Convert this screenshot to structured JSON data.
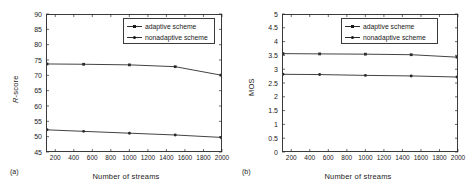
{
  "figure": {
    "panels": [
      {
        "tag": "(a)",
        "xlabel": "Number of streams",
        "ylabel_prefix": "R",
        "ylabel_suffix": "-score"
      },
      {
        "tag": "(b)",
        "xlabel": "Number of streams",
        "ylabel": "MOS"
      }
    ],
    "legend": {
      "adaptive": "adaptive scheme",
      "nonadaptive": "nonadaptive scheme"
    },
    "colors": {
      "line": "#2b2b2b",
      "frame": "#3a3a3a",
      "text": "#1a1a1a",
      "background": "#ffffff"
    }
  },
  "chart_data": [
    {
      "type": "line",
      "title": "",
      "panel": "(a)",
      "xlabel": "Number of streams",
      "ylabel": "R-score",
      "xlim": [
        100,
        2000
      ],
      "ylim": [
        45,
        90
      ],
      "yticks": [
        45,
        50,
        55,
        60,
        65,
        70,
        75,
        80,
        85,
        90
      ],
      "xticks": [
        200,
        400,
        600,
        800,
        1000,
        1200,
        1400,
        1600,
        1800,
        2000
      ],
      "grid": false,
      "legend_position": "top-right",
      "x": [
        100,
        500,
        1000,
        1500,
        2000
      ],
      "series": [
        {
          "name": "adaptive scheme",
          "values": [
            73.8,
            73.7,
            73.5,
            72.9,
            70.1
          ]
        },
        {
          "name": "nonadaptive scheme",
          "values": [
            52.0,
            51.5,
            50.9,
            50.3,
            49.5
          ]
        }
      ]
    },
    {
      "type": "line",
      "title": "",
      "panel": "(b)",
      "xlabel": "Number of streams",
      "ylabel": "MOS",
      "xlim": [
        100,
        2000
      ],
      "ylim": [
        0,
        5
      ],
      "yticks": [
        0,
        0.5,
        1,
        1.5,
        2,
        2.5,
        3,
        3.5,
        4,
        4.5,
        5
      ],
      "xticks": [
        200,
        400,
        600,
        800,
        1000,
        1200,
        1400,
        1600,
        1800,
        2000
      ],
      "grid": false,
      "legend_position": "top-right",
      "x": [
        100,
        500,
        1000,
        1500,
        2000
      ],
      "series": [
        {
          "name": "adaptive scheme",
          "values": [
            3.58,
            3.57,
            3.56,
            3.54,
            3.45
          ]
        },
        {
          "name": "nonadaptive scheme",
          "values": [
            2.82,
            2.81,
            2.78,
            2.76,
            2.72
          ]
        }
      ]
    }
  ]
}
